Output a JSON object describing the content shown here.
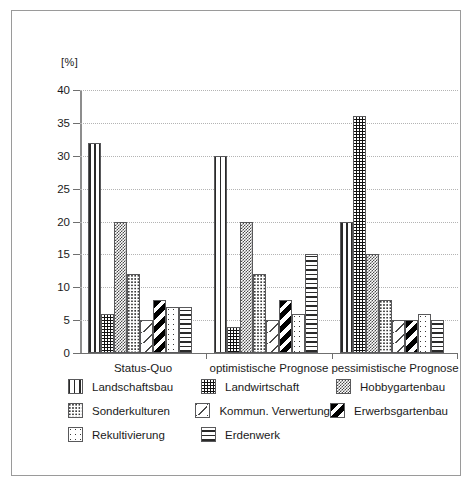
{
  "chart_data": {
    "type": "bar",
    "title": "",
    "subtitle": "",
    "xlabel": "",
    "ylabel": "[%]",
    "unit_label": "[%]",
    "ylim": [
      0,
      40
    ],
    "ytick_step": 5,
    "yticks": [
      "0",
      "5",
      "10",
      "15",
      "20",
      "25",
      "30",
      "35",
      "40"
    ],
    "grid": true,
    "legend_position": "bottom",
    "categories": [
      "Status-Quo",
      "optimistische Prognose",
      "pessimistische Prognose"
    ],
    "series": [
      {
        "name": "Landschaftsbau",
        "pattern": "vertical-stripes",
        "values": [
          32,
          30,
          20
        ]
      },
      {
        "name": "Landwirtschaft",
        "pattern": "dark-dotted",
        "values": [
          6,
          4,
          36
        ]
      },
      {
        "name": "Hobbygartenbau",
        "pattern": "checkered",
        "values": [
          20,
          20,
          15
        ]
      },
      {
        "name": "Sonderkulturen",
        "pattern": "fine-dots",
        "values": [
          12,
          12,
          8
        ]
      },
      {
        "name": "Kommun. Verwertung",
        "pattern": "diagonal-dashes",
        "values": [
          5,
          5,
          5
        ]
      },
      {
        "name": "Erwerbsgartenbau",
        "pattern": "bold-diagonal",
        "values": [
          8,
          8,
          5
        ]
      },
      {
        "name": "Rekultivierung",
        "pattern": "sparse-dots",
        "values": [
          7,
          6,
          6
        ]
      },
      {
        "name": "Erdenwerk",
        "pattern": "horizontal-stripes",
        "values": [
          7,
          15,
          5
        ]
      }
    ]
  },
  "legend": {
    "rows": [
      [
        {
          "label": "Landschaftsbau",
          "pattern": "vertical-stripes"
        },
        {
          "label": "Landwirtschaft",
          "pattern": "dark-dotted"
        },
        {
          "label": "Hobbygartenbau",
          "pattern": "checkered"
        }
      ],
      [
        {
          "label": "Sonderkulturen",
          "pattern": "fine-dots"
        },
        {
          "label": "Kommun. Verwertung",
          "pattern": "diagonal-dashes"
        },
        {
          "label": "Erwerbsgartenbau",
          "pattern": "bold-diagonal"
        }
      ],
      [
        {
          "label": "Rekultivierung",
          "pattern": "sparse-dots"
        },
        {
          "label": "Erdenwerk",
          "pattern": "horizontal-stripes"
        },
        {
          "label": "",
          "pattern": ""
        }
      ]
    ]
  },
  "colors": {
    "frame": "#9a9a9a",
    "axis": "#6f6f6f",
    "grid": "#b4b4b4",
    "bar_outline": "#59595b",
    "text": "#1a1a1a"
  }
}
